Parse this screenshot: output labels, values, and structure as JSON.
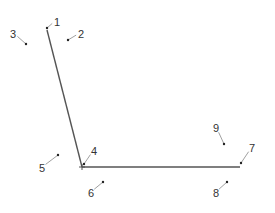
{
  "diagram": {
    "type": "labeled-keypoint-figure",
    "line_color": "#555555",
    "leader_color": "#888888",
    "text_color": "#333333",
    "segments": [
      {
        "id": "upper-segment",
        "x1": 47,
        "y1": 30,
        "x2": 82,
        "y2": 167
      },
      {
        "id": "lower-segment",
        "x1": 82,
        "y1": 167,
        "x2": 240,
        "y2": 167
      }
    ],
    "points": [
      {
        "label": "1",
        "px": 47,
        "py": 28,
        "lx": 57,
        "ly": 25
      },
      {
        "label": "2",
        "px": 68,
        "py": 40,
        "lx": 81,
        "ly": 37
      },
      {
        "label": "3",
        "px": 26,
        "py": 44,
        "lx": 13,
        "ly": 37
      },
      {
        "label": "4",
        "px": 84,
        "py": 164,
        "lx": 94,
        "ly": 154
      },
      {
        "label": "5",
        "px": 58,
        "py": 155,
        "lx": 42,
        "ly": 171
      },
      {
        "label": "6",
        "px": 103,
        "py": 182,
        "lx": 91,
        "ly": 196
      },
      {
        "label": "7",
        "px": 241,
        "py": 163,
        "lx": 252,
        "ly": 151
      },
      {
        "label": "8",
        "px": 227,
        "py": 182,
        "lx": 216,
        "ly": 196
      },
      {
        "label": "9",
        "px": 224,
        "py": 144,
        "lx": 216,
        "ly": 131
      }
    ]
  }
}
